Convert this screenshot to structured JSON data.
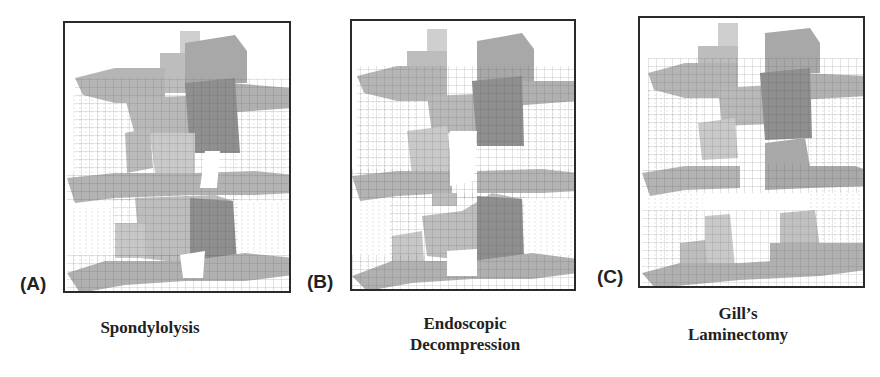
{
  "figure": {
    "panels": [
      {
        "id": "A",
        "label": "(A)",
        "caption_lines": [
          "Spondylolysis"
        ],
        "model_state": "intact-posterior-elements-with-pars-defect"
      },
      {
        "id": "B",
        "label": "(B)",
        "caption_lines": [
          "Endoscopic",
          "Decompression"
        ],
        "model_state": "partial-lamina-removal"
      },
      {
        "id": "C",
        "label": "(C)",
        "caption_lines": [
          "Gill’s",
          "Laminectomy"
        ],
        "model_state": "posterior-element-removed"
      }
    ],
    "colors": {
      "frame_border": "#2a2a2a",
      "mesh_light": "#cfcfcf",
      "mesh_mid": "#a9a9a9",
      "mesh_dark": "#7f7f7f",
      "mesh_lines": "#555555",
      "ligament_lines": "#c8c8c8",
      "text": "#222222"
    }
  }
}
